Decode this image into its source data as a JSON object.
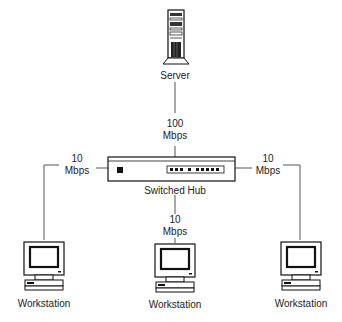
{
  "diagram": {
    "type": "network-topology",
    "nodes": [
      {
        "id": "server",
        "label": "Server",
        "icon": "server-tower-icon"
      },
      {
        "id": "hub",
        "label": "Switched Hub",
        "icon": "switched-hub-icon"
      },
      {
        "id": "ws_left",
        "label": "Workstation",
        "icon": "workstation-computer-icon"
      },
      {
        "id": "ws_center",
        "label": "Workstation",
        "icon": "workstation-computer-icon"
      },
      {
        "id": "ws_right",
        "label": "Workstation",
        "icon": "workstation-computer-icon"
      }
    ],
    "links": [
      {
        "from": "server",
        "to": "hub",
        "speed_value": "100",
        "speed_unit": "Mbps"
      },
      {
        "from": "hub",
        "to": "ws_left",
        "speed_value": "10",
        "speed_unit": "Mbps"
      },
      {
        "from": "hub",
        "to": "ws_center",
        "speed_value": "10",
        "speed_unit": "Mbps"
      },
      {
        "from": "hub",
        "to": "ws_right",
        "speed_value": "10",
        "speed_unit": "Mbps"
      }
    ],
    "colors": {
      "line": "#555555",
      "stroke": "#111111",
      "background": "#ffffff"
    }
  }
}
